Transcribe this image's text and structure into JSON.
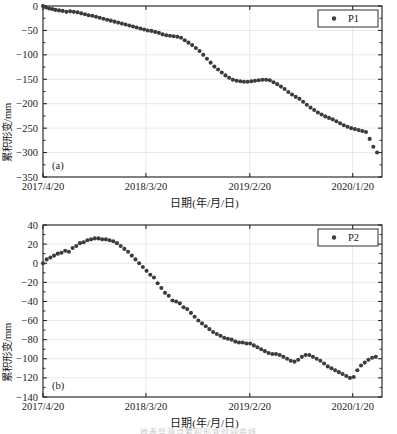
{
  "figure": {
    "width": 397,
    "height": 434,
    "background": "#ffffff",
    "marker_color": "#3c3c3c",
    "axis_color": "#1a1a1a",
    "grid_color": "#d8d8d8",
    "footer_partial_text": "地表监测点累积形变时间曲线"
  },
  "chart_data": [
    {
      "type": "scatter",
      "panel_tag": "(a)",
      "title": "",
      "xlabel": "日期(年/月/日)",
      "ylabel": "累积形变/mm",
      "legend": [
        {
          "name": "P1",
          "marker": "circle",
          "color": "#3c3c3c"
        }
      ],
      "legend_position": "top-right",
      "grid": true,
      "xlim": [
        0,
        1100
      ],
      "ylim": [
        -350,
        0
      ],
      "yticks": [
        0,
        -50,
        -100,
        -150,
        -200,
        -250,
        -300,
        -350
      ],
      "ytick_labels": [
        "0",
        "−50",
        "−100",
        "−150",
        "−200",
        "−250",
        "−300",
        "−350"
      ],
      "xticks": [
        0,
        334,
        671,
        1005
      ],
      "xtick_labels": [
        "2017/4/20",
        "2018/3/20",
        "2019/2/20",
        "2020/1/20"
      ],
      "x": [
        0,
        10,
        20,
        30,
        40,
        52,
        64,
        76,
        88,
        100,
        112,
        124,
        136,
        148,
        160,
        172,
        184,
        196,
        208,
        220,
        232,
        244,
        256,
        268,
        280,
        292,
        304,
        316,
        328,
        340,
        352,
        364,
        376,
        388,
        400,
        412,
        424,
        436,
        448,
        460,
        472,
        484,
        496,
        508,
        520,
        532,
        544,
        556,
        568,
        580,
        592,
        604,
        616,
        628,
        640,
        652,
        664,
        676,
        688,
        700,
        712,
        724,
        736,
        748,
        760,
        772,
        784,
        796,
        808,
        820,
        832,
        844,
        856,
        868,
        880,
        892,
        904,
        916,
        928,
        940,
        952,
        964,
        976,
        988,
        1000,
        1012,
        1024,
        1036,
        1048,
        1060,
        1072,
        1084
      ],
      "y": [
        0,
        -3,
        -5,
        -6,
        -8,
        -9,
        -10,
        -12,
        -11,
        -12,
        -13,
        -15,
        -17,
        -19,
        -20,
        -22,
        -24,
        -26,
        -28,
        -30,
        -32,
        -34,
        -36,
        -38,
        -40,
        -42,
        -44,
        -46,
        -48,
        -50,
        -51,
        -53,
        -55,
        -58,
        -60,
        -61,
        -62,
        -63,
        -65,
        -70,
        -75,
        -80,
        -86,
        -92,
        -100,
        -108,
        -116,
        -124,
        -130,
        -136,
        -142,
        -147,
        -151,
        -153,
        -154,
        -155,
        -155,
        -154,
        -153,
        -152,
        -151,
        -151,
        -152,
        -156,
        -160,
        -165,
        -170,
        -176,
        -181,
        -186,
        -190,
        -196,
        -202,
        -208,
        -213,
        -218,
        -222,
        -226,
        -229,
        -232,
        -236,
        -240,
        -244,
        -247,
        -250,
        -252,
        -254,
        -256,
        -258,
        -272,
        -288,
        -300,
        -318
      ]
    },
    {
      "type": "scatter",
      "panel_tag": "(b)",
      "title": "",
      "xlabel": "日期(年/月/日)",
      "ylabel": "累积形变/mm",
      "legend": [
        {
          "name": "P2",
          "marker": "circle",
          "color": "#3c3c3c"
        }
      ],
      "legend_position": "top-right",
      "grid": true,
      "xlim": [
        0,
        1100
      ],
      "ylim": [
        -140,
        40
      ],
      "yticks": [
        40,
        20,
        0,
        -20,
        -40,
        -60,
        -80,
        -100,
        -120,
        -140
      ],
      "ytick_labels": [
        "40",
        "20",
        "0",
        "−20",
        "−40",
        "−60",
        "−80",
        "−100",
        "−120",
        "−140"
      ],
      "xticks": [
        0,
        334,
        671,
        1005
      ],
      "xtick_labels": [
        "2017/4/20",
        "2018/3/20",
        "2019/2/20",
        "2020/1/20"
      ],
      "x": [
        0,
        12,
        24,
        36,
        48,
        60,
        72,
        84,
        96,
        108,
        120,
        132,
        144,
        156,
        168,
        180,
        192,
        204,
        216,
        228,
        240,
        252,
        264,
        276,
        288,
        300,
        312,
        324,
        336,
        348,
        360,
        372,
        384,
        396,
        408,
        420,
        432,
        444,
        456,
        468,
        480,
        492,
        504,
        516,
        528,
        540,
        552,
        564,
        576,
        588,
        600,
        612,
        624,
        636,
        648,
        660,
        672,
        684,
        696,
        708,
        720,
        732,
        744,
        756,
        768,
        780,
        792,
        804,
        816,
        828,
        840,
        852,
        864,
        876,
        888,
        900,
        912,
        924,
        936,
        948,
        960,
        972,
        984,
        996,
        1008,
        1020,
        1032,
        1044,
        1056,
        1068,
        1080
      ],
      "y": [
        0,
        4,
        6,
        8,
        10,
        11,
        13,
        12,
        16,
        18,
        21,
        22,
        24,
        25,
        26,
        26,
        25,
        25,
        24,
        23,
        21,
        18,
        15,
        12,
        8,
        4,
        0,
        -4,
        -8,
        -12,
        -15,
        -21,
        -26,
        -31,
        -34,
        -39,
        -40,
        -42,
        -46,
        -48,
        -52,
        -56,
        -60,
        -63,
        -66,
        -69,
        -72,
        -74,
        -76,
        -78,
        -79,
        -80,
        -82,
        -83,
        -83,
        -84,
        -84,
        -86,
        -88,
        -90,
        -92,
        -94,
        -95,
        -95,
        -96,
        -98,
        -100,
        -102,
        -103,
        -101,
        -98,
        -96,
        -96,
        -98,
        -100,
        -102,
        -105,
        -108,
        -110,
        -112,
        -114,
        -116,
        -118,
        -120,
        -119,
        -112,
        -107,
        -104,
        -101,
        -99,
        -98
      ]
    }
  ]
}
